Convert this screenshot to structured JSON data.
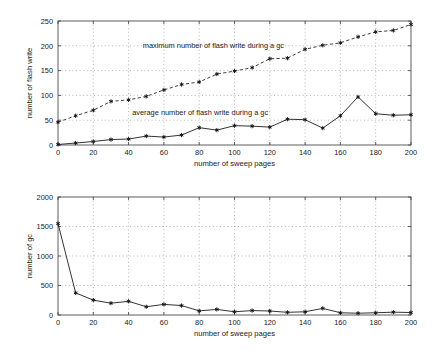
{
  "figure": {
    "background_color": "#ffffff",
    "line_color": "#1c1c1c",
    "grid_color": "#9a9a9a",
    "axis_color": "#4d4d4d"
  },
  "chart_data": [
    {
      "type": "line",
      "id": "flash-write-chart",
      "title": "",
      "xlabel": "number of sweep pages",
      "ylabel": "number of flash write",
      "xlim": [
        0,
        200
      ],
      "ylim": [
        0,
        250
      ],
      "xticks": [
        0,
        20,
        40,
        60,
        80,
        100,
        120,
        140,
        160,
        180,
        200
      ],
      "yticks": [
        0,
        50,
        100,
        150,
        200,
        250
      ],
      "xtick_labels": [
        "0",
        "20",
        "40",
        "60",
        "80",
        "100",
        "120",
        "140",
        "160",
        "180",
        "200"
      ],
      "ytick_labels": [
        "0",
        "50",
        "100",
        "150",
        "200",
        "250"
      ],
      "grid": true,
      "legend": "none",
      "x": [
        0,
        10,
        20,
        30,
        40,
        50,
        60,
        70,
        80,
        90,
        100,
        110,
        120,
        130,
        140,
        150,
        160,
        170,
        180,
        190,
        200
      ],
      "series": [
        {
          "name": "maximum number of flash write during a gc",
          "style": "dashed",
          "marker": "asterisk",
          "values": [
            46,
            59,
            70,
            88,
            91,
            98,
            111,
            122,
            127,
            143,
            149,
            156,
            174,
            175,
            193,
            201,
            206,
            218,
            228,
            231,
            243
          ]
        },
        {
          "name": "average number of flash write during a gc",
          "style": "solid",
          "marker": "asterisk",
          "values": [
            1,
            4,
            7,
            11,
            12,
            18,
            16,
            20,
            35,
            30,
            39,
            38,
            36,
            52,
            51,
            34,
            59,
            97,
            63,
            60,
            61
          ]
        }
      ],
      "annotations": [
        {
          "text": "maximum number of flash write during a gc",
          "x": 48,
          "y": 196
        },
        {
          "text": "average number of flash write during a gc",
          "x": 42,
          "y": 60
        }
      ]
    },
    {
      "type": "line",
      "id": "gc-count-chart",
      "title": "",
      "xlabel": "number of sweep pages",
      "ylabel": "number of gc",
      "xlim": [
        0,
        200
      ],
      "ylim": [
        0,
        2000
      ],
      "xticks": [
        0,
        20,
        40,
        60,
        80,
        100,
        120,
        140,
        160,
        180,
        200
      ],
      "yticks": [
        0,
        500,
        1000,
        1500,
        2000
      ],
      "xtick_labels": [
        "0",
        "20",
        "40",
        "60",
        "80",
        "100",
        "120",
        "140",
        "160",
        "180",
        "200"
      ],
      "ytick_labels": [
        "0",
        "500",
        "1000",
        "1500",
        "2000"
      ],
      "grid": true,
      "legend": "none",
      "x": [
        0,
        10,
        20,
        30,
        40,
        50,
        60,
        70,
        80,
        90,
        100,
        110,
        120,
        130,
        140,
        150,
        160,
        170,
        180,
        190,
        200
      ],
      "series": [
        {
          "name": "number of gc",
          "style": "solid",
          "marker": "asterisk",
          "values": [
            1550,
            375,
            252,
            200,
            232,
            140,
            180,
            160,
            70,
            95,
            55,
            75,
            68,
            45,
            55,
            112,
            38,
            30,
            38,
            48,
            42
          ]
        }
      ],
      "annotations": []
    }
  ]
}
